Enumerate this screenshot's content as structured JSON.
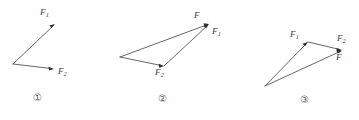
{
  "figure": {
    "background_color": "#ffffff",
    "line_color": "#555555",
    "arrowhead_color": "#2e2e2e",
    "label_color": "#3d3d3d",
    "panels": [
      {
        "id": "panel-1",
        "number_label": "①",
        "number_x": 33,
        "number_y": 93,
        "origin": {
          "x": 13,
          "y": 64
        },
        "vectors": [
          {
            "name": "F1",
            "label_text": "F",
            "label_sub": "1",
            "label_x": 40,
            "label_y": 8,
            "from_x": 13,
            "from_y": 64,
            "to_x": 55,
            "to_y": 24
          },
          {
            "name": "F2",
            "label_text": "F",
            "label_sub": "2",
            "label_x": 58,
            "label_y": 67,
            "from_x": 13,
            "from_y": 64,
            "to_x": 54,
            "to_y": 69
          }
        ]
      },
      {
        "id": "panel-2",
        "number_label": "②",
        "number_x": 158,
        "number_y": 94,
        "origin": {
          "x": 120,
          "y": 57
        },
        "vectors": [
          {
            "name": "F",
            "label_text": "F",
            "label_sub": "",
            "label_x": 194,
            "label_y": 11,
            "from_x": 120,
            "from_y": 57,
            "to_x": 209,
            "to_y": 24
          },
          {
            "name": "F2",
            "label_text": "F",
            "label_sub": "2",
            "label_x": 155,
            "label_y": 68,
            "from_x": 120,
            "from_y": 57,
            "to_x": 164,
            "to_y": 66
          },
          {
            "name": "F1",
            "label_text": "F",
            "label_sub": "1",
            "label_x": 212,
            "label_y": 27,
            "from_x": 164,
            "from_y": 66,
            "to_x": 209,
            "to_y": 24
          }
        ]
      },
      {
        "id": "panel-3",
        "number_label": "③",
        "number_x": 300,
        "number_y": 95,
        "origin": {
          "x": 265,
          "y": 86
        },
        "vectors": [
          {
            "name": "F1",
            "label_text": "F",
            "label_sub": "1",
            "label_x": 290,
            "label_y": 30,
            "from_x": 265,
            "from_y": 86,
            "to_x": 308,
            "to_y": 42
          },
          {
            "name": "F2",
            "label_text": "F",
            "label_sub": "2",
            "label_x": 337,
            "label_y": 34,
            "from_x": 308,
            "from_y": 42,
            "to_x": 342,
            "to_y": 50
          },
          {
            "name": "F",
            "label_text": "F",
            "label_sub": "",
            "label_x": 336,
            "label_y": 53,
            "from_x": 265,
            "from_y": 86,
            "to_x": 342,
            "to_y": 51
          }
        ]
      }
    ]
  }
}
